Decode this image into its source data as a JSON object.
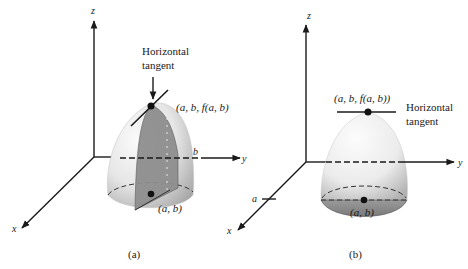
{
  "figure_a": {
    "caption": "(a)",
    "axis_z": "z",
    "axis_y": "y",
    "axis_x": "x",
    "tick_b": "b",
    "annotation": [
      "Horizontal",
      "tangent"
    ],
    "top_point_label": "(a, b, f(a, b)",
    "base_point_label": "(a, b)"
  },
  "figure_b": {
    "caption": "(b)",
    "axis_z": "z",
    "axis_y": "y",
    "axis_x": "x",
    "tick_a": "a",
    "annotation": [
      "Horizontal",
      "tangent"
    ],
    "top_point_label": "(a, b, f(a, b))",
    "base_point_label": "(a, b)"
  },
  "colors": {
    "ink": "#1a1a1a",
    "surface_light": "#f4f4f4",
    "surface_shade": "#b8b8b8",
    "slice_fill": "#8a8a8a",
    "base_fill": "#9a9a9a"
  }
}
